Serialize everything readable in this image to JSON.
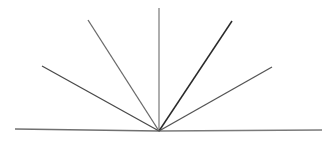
{
  "figure": {
    "width": 336,
    "height": 142,
    "background_color": "#ffffff"
  },
  "chart_data": {
    "type": "scatter",
    "subtitle": "",
    "xlabel": "",
    "ylabel": "",
    "xlim": [
      0,
      336
    ],
    "ylim": [
      0,
      142
    ],
    "grid": false,
    "legend": "none",
    "annotations": [],
    "tick_labels": {
      "x": [],
      "y": []
    },
    "vertex": {
      "name": "common-vertex",
      "x": 159,
      "y": 131
    },
    "series": [
      {
        "name": "baseline-left",
        "label": "Horizontal baseline (left arm)",
        "x1": 15,
        "y1": 129,
        "x2": 159,
        "y2": 131,
        "color": "#707070",
        "width": 1.4,
        "angle_deg": 179.2
      },
      {
        "name": "baseline-right",
        "label": "Horizontal baseline (right arm)",
        "x1": 159,
        "y1": 131,
        "x2": 322,
        "y2": 130,
        "color": "#7a7a7a",
        "width": 1.4,
        "angle_deg": 0.4
      },
      {
        "name": "ray-left-shallow",
        "label": "Upper-left shallow ray",
        "x1": 159,
        "y1": 131,
        "x2": 42,
        "y2": 66,
        "color": "#4a4a4a",
        "width": 1.3,
        "angle_deg": 151.0
      },
      {
        "name": "ray-left-steep",
        "label": "Upper-left steep ray",
        "x1": 159,
        "y1": 131,
        "x2": 88,
        "y2": 20,
        "color": "#6a6a6a",
        "width": 1.3,
        "angle_deg": 122.6
      },
      {
        "name": "ray-vertical",
        "label": "Vertical ray",
        "x1": 159,
        "y1": 131,
        "x2": 159,
        "y2": 8,
        "color": "#838383",
        "width": 1.3,
        "angle_deg": 90.0
      },
      {
        "name": "ray-right-steep",
        "label": "Upper-right steep ray",
        "x1": 159,
        "y1": 131,
        "x2": 232,
        "y2": 21,
        "color": "#2a2a2a",
        "width": 1.5,
        "angle_deg": 56.4
      },
      {
        "name": "ray-right-shallow",
        "label": "Upper-right shallow ray",
        "x1": 159,
        "y1": 131,
        "x2": 272,
        "y2": 67,
        "color": "#555555",
        "width": 1.3,
        "angle_deg": 29.5
      }
    ]
  }
}
